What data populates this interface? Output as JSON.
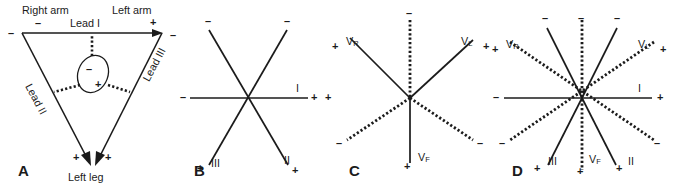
{
  "figure": {
    "ink_color": "#1b1b1b",
    "background": "#ffffff"
  },
  "panels": [
    {
      "letter": "A",
      "name": "einthoven-triangle",
      "labels": {
        "right_arm": "Right arm",
        "left_arm": "Left arm",
        "left_leg": "Left leg",
        "lead_1": "Lead I",
        "lead_2": "Lead II",
        "lead_3": "Lead III"
      },
      "signs": {
        "right_arm_minus": "–",
        "right_vertex_minus": "–",
        "left_arm_plus": "+",
        "left_vertex_minus": "–",
        "left_leg_plus_left": "+",
        "left_leg_plus_right": "+",
        "heart_minus": "–",
        "heart_plus": "+"
      }
    },
    {
      "letter": "B",
      "name": "standard-limb-lead-axes",
      "labels": {
        "lead_1": "I",
        "lead_2": "II",
        "lead_3": "III"
      },
      "signs": {
        "upper_left_minus": "–",
        "upper_right_minus": "–",
        "left_minus": "–",
        "right_plus": "+",
        "lower_left_plus": "+",
        "lower_right_plus": "+"
      }
    },
    {
      "letter": "C",
      "name": "augmented-limb-lead-axes",
      "labels": {
        "avr": "V",
        "avr_sub": "R",
        "avl": "V",
        "avl_sub": "L",
        "avf": "V",
        "avf_sub": "F"
      },
      "signs": {
        "avr_plus": "+",
        "avl_plus": "+",
        "avf_plus": "+",
        "top_minus": "–",
        "lower_left_minus": "–",
        "lower_right_minus": "–"
      }
    },
    {
      "letter": "D",
      "name": "hexaxial-reference-system",
      "labels": {
        "lead_1": "I",
        "lead_2": "II",
        "lead_3": "III",
        "avr": "V",
        "avr_sub": "R",
        "avl": "V",
        "avl_sub": "L",
        "avf": "V",
        "avf_sub": "F"
      },
      "signs": {
        "avr_plus": "+",
        "avl_plus": "+",
        "lead1_minus": "–",
        "lead1_plus": "+",
        "lead3_minus": "–",
        "lead2_minus": "–",
        "avf_minus": "–",
        "lead3_plus": "+",
        "lead2_plus": "+",
        "avf_plus": "+",
        "avr_minus": "–",
        "avl_minus": "–"
      }
    }
  ]
}
